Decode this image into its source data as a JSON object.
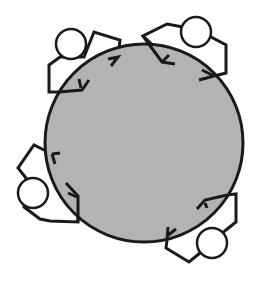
{
  "diagram": {
    "table": {
      "shape": "circle",
      "fill": "#b3b3b3",
      "stroke": "#1a1a1a",
      "cx": 144,
      "cy": 143,
      "r": 99
    },
    "people": [
      {
        "id": "top-left",
        "head": {
          "cx": 71,
          "cy": 44,
          "r": 15
        }
      },
      {
        "id": "top-right",
        "head": {
          "cx": 196,
          "cy": 32,
          "r": 15
        }
      },
      {
        "id": "left",
        "head": {
          "cx": 33,
          "cy": 193,
          "r": 15
        }
      },
      {
        "id": "bottom-right",
        "head": {
          "cx": 212,
          "cy": 243,
          "r": 15
        }
      }
    ]
  }
}
